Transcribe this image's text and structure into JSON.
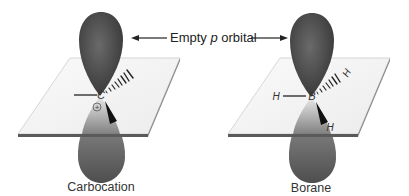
{
  "figure": {
    "annotation": {
      "prefix": "Empty ",
      "italic": "p",
      "suffix": " orbital"
    },
    "panels": [
      {
        "caption": "Carbocation",
        "central_atom": "C",
        "charge": "+",
        "substituents": [
          "",
          "",
          ""
        ]
      },
      {
        "caption": "Borane",
        "central_atom": "B",
        "charge": "",
        "substituents": [
          "H",
          "H",
          "H"
        ]
      }
    ],
    "colors": {
      "lobe_dark": "#4a4a4a",
      "lobe_mid": "#7a7a7a",
      "plane_fill": "#f4f4f4",
      "plane_edge": "#5a5a5a",
      "text": "#222222"
    }
  }
}
